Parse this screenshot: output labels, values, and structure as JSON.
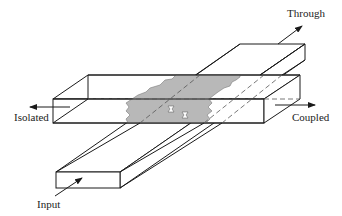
{
  "diagram": {
    "type": "directional-coupler-waveguide",
    "labels": {
      "through": "Through",
      "isolated": "Isolated",
      "coupled": "Coupled",
      "input": "Input"
    },
    "colors": {
      "line": "#1a1a1a",
      "coupling_region": "#b8b8b8",
      "dashed": "#555555",
      "background": "#ffffff"
    }
  }
}
